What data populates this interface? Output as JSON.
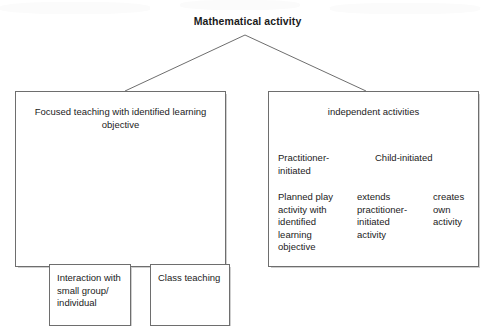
{
  "diagram": {
    "title": "Mathematical activity",
    "branches": [
      {
        "id": "focused-teaching",
        "heading": "Focused teaching with identified learning objective",
        "children": [
          {
            "id": "interaction",
            "label": "Interaction with small group/ individual"
          },
          {
            "id": "class-teaching",
            "label": "Class teaching"
          }
        ]
      },
      {
        "id": "independent-activities",
        "heading": "independent activities",
        "children": [
          {
            "id": "practitioner-initiated",
            "label": "Practitioner-initiated",
            "children": [
              {
                "id": "planned-play",
                "label": "Planned play activity with identified learning objective"
              }
            ]
          },
          {
            "id": "child-initiated",
            "label": "Child-initiated",
            "children": [
              {
                "id": "extends-practitioner",
                "label": "extends practitioner-initiated activity"
              },
              {
                "id": "creates-own",
                "label": "creates own activity"
              }
            ]
          }
        ]
      }
    ]
  },
  "style": {
    "line_color": "#6e6e6e",
    "text_color": "#1b1b1b",
    "background": "#ffffff"
  }
}
